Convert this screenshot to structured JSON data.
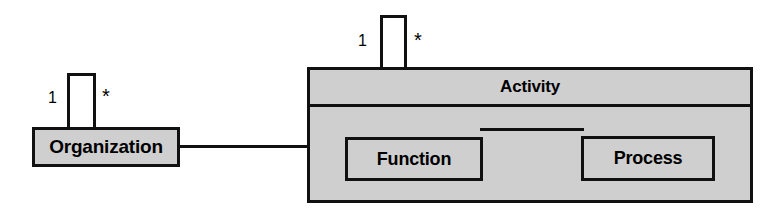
{
  "diagram": {
    "type": "uml-class-diagram",
    "canvas": {
      "width": 780,
      "height": 215,
      "background": "#ffffff"
    },
    "style": {
      "node_fill": "#cfcfcf",
      "node_border": "#111111",
      "line_color": "#111111",
      "text_color": "#000000"
    },
    "nodes": [
      {
        "id": "organization",
        "label": "Organization",
        "kind": "class",
        "x": 32,
        "y": 127,
        "width": 148,
        "height": 40
      },
      {
        "id": "activity",
        "label": "Activity",
        "kind": "composite-class",
        "x": 307,
        "y": 67,
        "width": 446,
        "height": 136,
        "children": [
          "function",
          "process"
        ]
      },
      {
        "id": "function",
        "label": "Function",
        "kind": "class",
        "parent": "activity",
        "x": 342,
        "y": 134,
        "width": 138,
        "height": 44
      },
      {
        "id": "process",
        "label": "Process",
        "kind": "class",
        "parent": "activity",
        "x": 578,
        "y": 133,
        "width": 134,
        "height": 45
      }
    ],
    "associations": [
      {
        "id": "organization-activity",
        "from": "organization",
        "to": "activity",
        "style": "plain-line"
      },
      {
        "id": "function-process",
        "from": "function",
        "to": "process",
        "style": "plain-line"
      },
      {
        "id": "organization-self",
        "from": "organization",
        "to": "organization",
        "style": "self-loop",
        "source_multiplicity": "1",
        "target_multiplicity": "*"
      },
      {
        "id": "activity-self",
        "from": "activity",
        "to": "activity",
        "style": "self-loop",
        "source_multiplicity": "1",
        "target_multiplicity": "*"
      }
    ],
    "multiplicity_labels": {
      "organization_one": "1",
      "organization_many": "*",
      "activity_one": "1",
      "activity_many": "*"
    }
  }
}
